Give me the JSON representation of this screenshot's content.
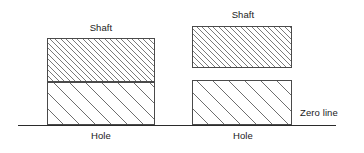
{
  "diagram": {
    "width": 364,
    "height": 153,
    "background_color": "#ffffff",
    "line_color": "#2b2b2b",
    "box_border_color": "#4a4a4a",
    "hatch_color": "#7a7a7a",
    "text_color": "#1a1a1a"
  },
  "zero_line": {
    "label": "Zero line",
    "x_start": 18,
    "x_end": 336,
    "y": 125,
    "label_x": 300,
    "label_y": 108
  },
  "figures": [
    {
      "id": "left-fit",
      "fit_type": "transition-fit",
      "description": "Shaft zone stacked directly on hole zone, no gap",
      "shaft": {
        "label": "Shaft",
        "label_x": 101,
        "label_y": 23,
        "x": 47,
        "y": 38,
        "width": 108,
        "height": 44,
        "hatch": "dense",
        "touches_hole": true
      },
      "hole": {
        "label": "Hole",
        "label_x": 101,
        "label_y": 131,
        "x": 47,
        "y": 82,
        "width": 108,
        "height": 43,
        "hatch": "sparse",
        "sits_on_zero_line": true
      }
    },
    {
      "id": "right-fit",
      "fit_type": "clearance-fit",
      "description": "Shaft zone floats above hole zone with a clearance gap",
      "shaft": {
        "label": "Shaft",
        "label_x": 243,
        "label_y": 10,
        "x": 192,
        "y": 26,
        "width": 100,
        "height": 42,
        "hatch": "dense",
        "touches_hole": false
      },
      "hole": {
        "label": "Hole",
        "label_x": 243,
        "label_y": 131,
        "x": 192,
        "y": 80,
        "width": 100,
        "height": 45,
        "hatch": "sparse",
        "sits_on_zero_line": true
      },
      "gap": {
        "y_top": 68,
        "y_bottom": 80
      }
    }
  ]
}
